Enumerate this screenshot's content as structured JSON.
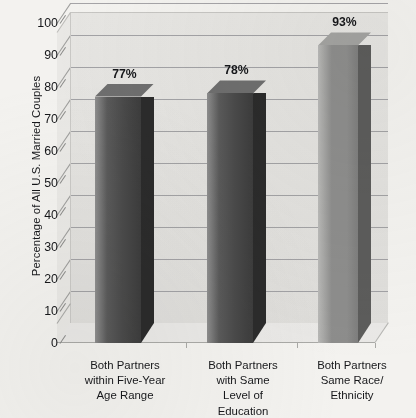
{
  "chart_data": {
    "type": "bar",
    "title": "",
    "subtitle": "",
    "xlabel": "",
    "ylabel": "Percentage of All U.S. Married Couples",
    "ylim": [
      0,
      100
    ],
    "ytick_step": 10,
    "grid": true,
    "legend": "none",
    "three_d": true,
    "categories": [
      "Both Partners within Five-Year Age Range",
      "Both Partners with Same Level of Education",
      "Both Partners Same Race/ Ethnicity"
    ],
    "values": [
      77,
      78,
      93
    ],
    "data_labels": [
      "77%",
      "78%",
      "93%"
    ],
    "ytick_labels": [
      "100",
      "90",
      "80",
      "70",
      "60",
      "50",
      "40",
      "30",
      "20",
      "10",
      "0"
    ],
    "ytick_values": [
      100,
      90,
      80,
      70,
      60,
      50,
      40,
      30,
      20,
      10,
      0
    ]
  },
  "axis": {
    "y_title": "Percentage of All U.S. Married Couples"
  },
  "categories_lines": [
    [
      "Both Partners",
      "within Five-Year",
      "Age Range"
    ],
    [
      "Both Partners",
      "with Same",
      "Level of",
      "Education"
    ],
    [
      "Both Partners",
      "Same Race/",
      "Ethnicity"
    ]
  ],
  "colors": {
    "page_background": "#f3f2ef",
    "plot_back_wall": "#e3e2df",
    "plot_floor": "#e9e8e6",
    "gridline": "#97979a",
    "bar_dark_light_edge": "#8e8e8e",
    "bar_dark_mid": "#4a4a4a",
    "bar_dark_side": "#2b2b2b",
    "bar_light_light_edge": "#b9b9b7",
    "bar_light_mid": "#8d8d8c",
    "bar_light_side": "#5c5c5b",
    "text": "#16171a"
  }
}
